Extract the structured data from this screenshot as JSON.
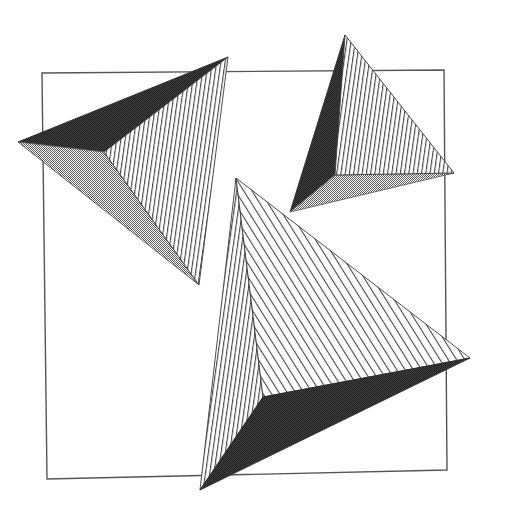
{
  "artwork": {
    "title": "Abstract Geometric Composition",
    "canvas": {
      "width": 506,
      "height": 518,
      "background": "#ffffff"
    },
    "palette": {
      "background": "#ffffff",
      "outline": "#3a3a3a",
      "dark_facet": "#272727",
      "gray_facet": "#a8a8a8",
      "hatch_stroke": "#444444",
      "frame_stroke": "#555555"
    },
    "frame": {
      "name": "tilted-square-frame",
      "stroke_width": 1.4,
      "points": "42,73 444,70 447,470 47,479"
    },
    "shapes": [
      {
        "id": "shape-top-left",
        "name": "triangle-cluster-top-left",
        "facets": [
          {
            "id": "tl-dark",
            "fill": "dark",
            "points": "18,142 228,57 104,152"
          },
          {
            "id": "tl-gray",
            "fill": "gray",
            "points": "18,142 104,152 199,285"
          },
          {
            "id": "tl-hatch",
            "fill": "hatch-vert",
            "points": "104,152 228,57 199,285"
          }
        ]
      },
      {
        "id": "shape-top-right",
        "name": "triangle-cluster-top-right",
        "facets": [
          {
            "id": "tr-dark",
            "fill": "dark",
            "points": "345,35 335,175 290,212"
          },
          {
            "id": "tr-gray",
            "fill": "gray",
            "points": "290,212 335,175 454,173"
          },
          {
            "id": "tr-hatch",
            "fill": "hatch-vert",
            "points": "345,35 454,173 335,175"
          }
        ]
      },
      {
        "id": "shape-bottom-center",
        "name": "triangle-cluster-bottom-center",
        "facets": [
          {
            "id": "bc-hatchv",
            "fill": "hatch-vert",
            "points": "236,178 263,397 200,490"
          },
          {
            "id": "bc-hatchd",
            "fill": "hatch-diag",
            "points": "236,178 470,358 263,397"
          },
          {
            "id": "bc-dark",
            "fill": "dark",
            "points": "263,397 470,358 200,490"
          }
        ]
      }
    ],
    "hatch": {
      "vertical": {
        "angle_deg": 8,
        "spacing": 4.2,
        "stroke_width": 1.1
      },
      "diagonal": {
        "angle_deg": -32,
        "spacing": 7.0,
        "stroke_width": 1.1
      }
    }
  }
}
